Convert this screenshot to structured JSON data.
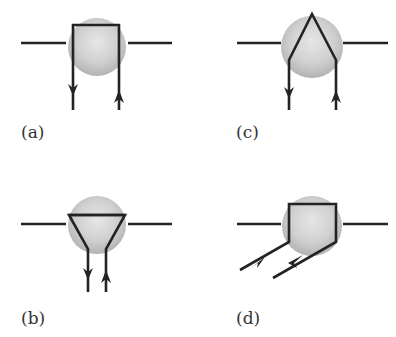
{
  "figure": {
    "panels": [
      {
        "id": "a",
        "label": "(a)",
        "description": "horizontal line with rectangular loop through blob; down arrow left, up arrow right"
      },
      {
        "id": "b",
        "label": "(b)",
        "description": "horizontal line with inverted triangular loop through blob; narrow legs with down/up arrows"
      },
      {
        "id": "c",
        "label": "(c)",
        "description": "horizontal line with peaked (inverted V) loop through blob; down arrow left, up arrow right"
      },
      {
        "id": "d",
        "label": "(d)",
        "description": "horizontal line with rectangular loop through blob; legs angled down-left with arrows"
      }
    ],
    "colors": {
      "line": "#232323",
      "blob_light": "#e4e4e4",
      "blob_dark": "#b5b5b5",
      "label": "#333333"
    }
  }
}
